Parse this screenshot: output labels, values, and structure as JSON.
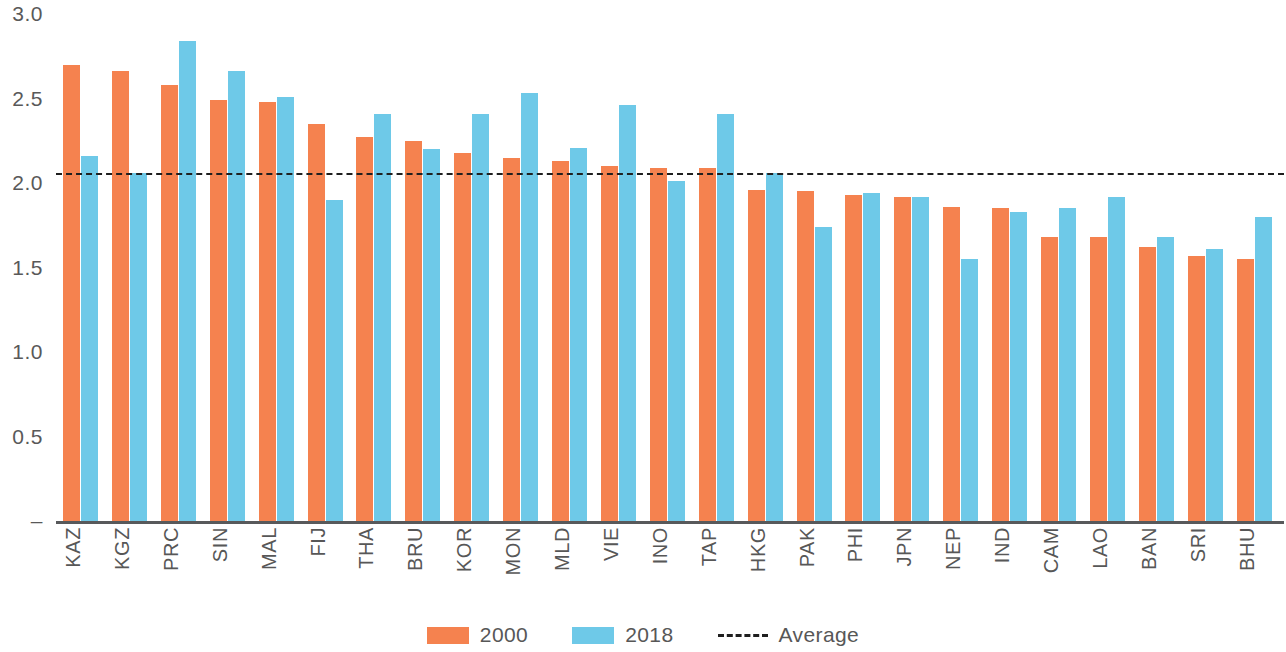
{
  "chart_data": {
    "type": "bar",
    "title": "",
    "subtitle": "",
    "xlabel": "",
    "ylabel": "",
    "ylim": [
      0,
      3.0
    ],
    "grid": false,
    "legend_position": "bottom",
    "y_ticks": [
      "3.0",
      "2.5",
      "2.0",
      "1.5",
      "1.0",
      "0.5",
      "–"
    ],
    "y_tick_values": [
      3.0,
      2.5,
      2.0,
      1.5,
      1.0,
      0.5,
      0
    ],
    "categories": [
      "KAZ",
      "KGZ",
      "PRC",
      "SIN",
      "MAL",
      "FIJ",
      "THA",
      "BRU",
      "KOR",
      "MON",
      "MLD",
      "VIE",
      "INO",
      "TAP",
      "HKG",
      "PAK",
      "PHI",
      "JPN",
      "NEP",
      "IND",
      "CAM",
      "LAO",
      "BAN",
      "SRI",
      "BHU"
    ],
    "series": [
      {
        "name": "2000",
        "color": "#f5824f",
        "values": [
          2.7,
          2.66,
          2.58,
          2.49,
          2.48,
          2.35,
          2.27,
          2.25,
          2.18,
          2.15,
          2.13,
          2.1,
          2.09,
          2.09,
          1.96,
          1.95,
          1.93,
          1.92,
          1.86,
          1.85,
          1.68,
          1.68,
          1.62,
          1.57,
          1.55
        ]
      },
      {
        "name": "2018",
        "color": "#6ec9e8",
        "values": [
          2.16,
          2.06,
          2.84,
          2.66,
          2.51,
          1.9,
          2.41,
          2.2,
          2.41,
          2.53,
          2.21,
          2.46,
          2.01,
          2.41,
          2.06,
          1.74,
          1.94,
          1.92,
          1.55,
          1.83,
          1.85,
          1.92,
          1.68,
          1.61,
          1.8
        ]
      }
    ],
    "average": {
      "name": "Average",
      "value": 2.06,
      "style": "dashed",
      "color": "#1f1f1f"
    }
  },
  "legend": {
    "items": [
      {
        "label": "2000",
        "swatch": "series2000"
      },
      {
        "label": "2018",
        "swatch": "series2018"
      },
      {
        "label": "Average",
        "swatch": "avg"
      }
    ]
  }
}
